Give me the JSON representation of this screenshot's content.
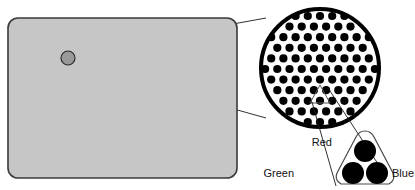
{
  "figure": {
    "background_color": "#ffffff",
    "line_color": "#1a1a1a",
    "dot_color": "#000000"
  },
  "screen": {
    "name": "display-screen",
    "shape": "rounded-rectangle",
    "fill_color": "#c6c6c6",
    "stroke_color": "#3a3a3a",
    "x": 8,
    "y": 18,
    "width": 229,
    "height": 160,
    "corner_radius": 10
  },
  "sample_spot": {
    "name": "sampled-screen-spot",
    "fill_color": "#9a9a9a",
    "stroke_color": "#2b2b2b",
    "cx": 68,
    "cy": 58,
    "r": 7
  },
  "magnifier": {
    "name": "magnified-dot-field",
    "cx": 320,
    "cy": 68,
    "r": 61,
    "stroke_color": "#000000",
    "stroke_width": 4,
    "fill_color": "#ffffff",
    "dot_radius": 4.1,
    "dot_spacing_x": 12.2,
    "dot_spacing_y": 10.6,
    "row_offset_x": 6.1,
    "pattern": "staggered-hex-grid"
  },
  "callout_lines": {
    "name": "magnifier-callout-lines",
    "from_spot_to_circle_top": {
      "x1": 73,
      "y1": 53,
      "x2": 266,
      "y2": 18
    },
    "from_spot_to_circle_bottom": {
      "x1": 73,
      "y1": 64,
      "x2": 266,
      "y2": 118
    }
  },
  "triad_callout": {
    "name": "triad-callout",
    "small_triangle": {
      "name": "triad-selection-marker",
      "cx": 320,
      "cy": 95,
      "size": 16
    },
    "lines": [
      {
        "x1": 312,
        "y1": 102,
        "x2": 336,
        "y2": 186
      },
      {
        "x1": 328,
        "y1": 88,
        "x2": 382,
        "y2": 170
      }
    ]
  },
  "triad": {
    "name": "phosphor-dot-triad",
    "outline_stroke": "#4a4a4a",
    "dots": [
      {
        "name": "red-phosphor-dot",
        "label": "Red",
        "cx": 365,
        "cy": 151,
        "r": 11,
        "color": "#000000"
      },
      {
        "name": "green-phosphor-dot",
        "label": "Green",
        "cx": 353,
        "cy": 173,
        "r": 11,
        "color": "#000000"
      },
      {
        "name": "blue-phosphor-dot",
        "label": "Blue",
        "cx": 377,
        "cy": 173,
        "r": 11,
        "color": "#000000"
      }
    ]
  },
  "labels": {
    "red": {
      "name": "label-red",
      "text": "Red",
      "x": 332,
      "y": 146
    },
    "green": {
      "name": "label-green",
      "text": "Green",
      "x": 294,
      "y": 177
    },
    "blue": {
      "name": "label-blue",
      "text": "Blue",
      "x": 392,
      "y": 177
    }
  }
}
